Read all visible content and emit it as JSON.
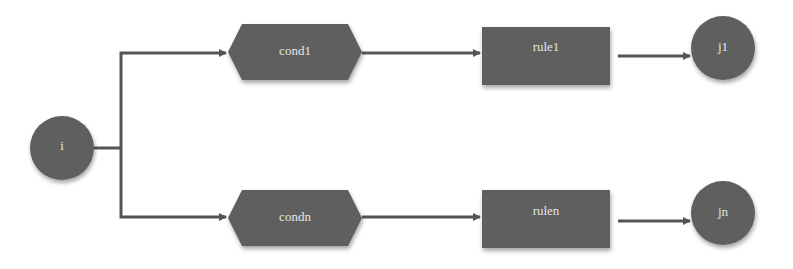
{
  "diagram": {
    "type": "flowchart",
    "colors": {
      "node_fill": "#5e5e5e",
      "edge": "#555555",
      "label": "#e6e6e6",
      "background": "#ffffff"
    },
    "nodes": [
      {
        "id": "i",
        "label": "i",
        "shape": "circle"
      },
      {
        "id": "cond1",
        "label": "cond1",
        "shape": "hexagon"
      },
      {
        "id": "rule1",
        "label": "rule1",
        "shape": "rectangle"
      },
      {
        "id": "j1",
        "label": "j1",
        "shape": "circle"
      },
      {
        "id": "condn",
        "label": "condn",
        "shape": "hexagon"
      },
      {
        "id": "rulen",
        "label": "rulen",
        "shape": "rectangle"
      },
      {
        "id": "jn",
        "label": "jn",
        "shape": "circle"
      }
    ],
    "edges": [
      {
        "from": "i",
        "to": "cond1"
      },
      {
        "from": "cond1",
        "to": "rule1"
      },
      {
        "from": "rule1",
        "to": "j1"
      },
      {
        "from": "i",
        "to": "condn"
      },
      {
        "from": "condn",
        "to": "rulen"
      },
      {
        "from": "rulen",
        "to": "jn"
      }
    ]
  }
}
